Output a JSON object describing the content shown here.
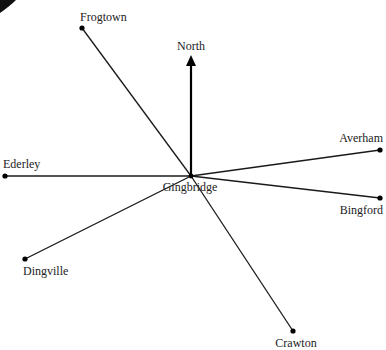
{
  "diagram": {
    "center": {
      "name": "Gingbridge",
      "x": 191,
      "y": 176
    },
    "compass": {
      "label": "North",
      "direction": "up"
    },
    "towns": [
      {
        "name": "Frogtown",
        "x": 82,
        "y": 28
      },
      {
        "name": "Ederley",
        "x": 5,
        "y": 176
      },
      {
        "name": "Averham",
        "x": 380,
        "y": 150
      },
      {
        "name": "Bingford",
        "x": 380,
        "y": 198
      },
      {
        "name": "Dingville",
        "x": 25,
        "y": 259
      },
      {
        "name": "Crawton",
        "x": 293,
        "y": 331
      }
    ],
    "colors": {
      "line": "#1a1a1a",
      "text": "#222222",
      "background": "#ffffff"
    }
  }
}
